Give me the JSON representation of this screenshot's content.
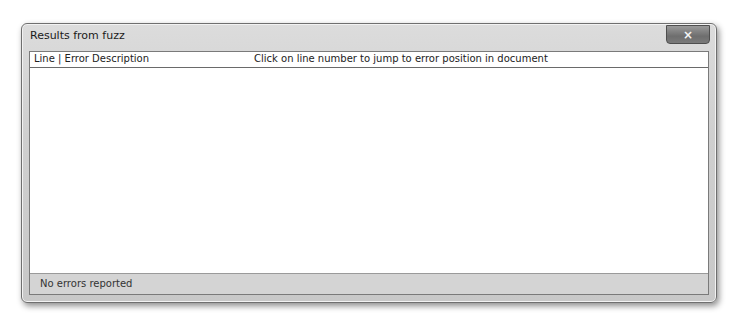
{
  "window": {
    "title": "Results from fuzz",
    "close_icon": "×"
  },
  "results": {
    "columns": [
      {
        "label": "Line | Error Description"
      },
      {
        "label": "Click on line number to jump to error position in document"
      }
    ],
    "rows": []
  },
  "status": {
    "text": "No errors reported"
  }
}
